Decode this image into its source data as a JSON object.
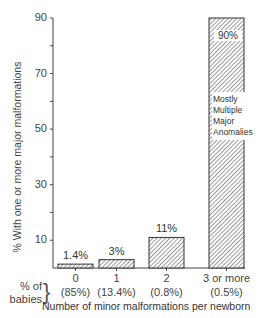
{
  "chart_data": {
    "type": "bar",
    "title": "",
    "xlabel": "Number of minor malformations per newborn",
    "ylabel": "% With one or more major malformations",
    "categories": [
      "0",
      "1",
      "2",
      "3 or more"
    ],
    "values": [
      1.4,
      3,
      11,
      90
    ],
    "value_labels": [
      "1.4%",
      "3%",
      "11%",
      "90%"
    ],
    "percent_of_babies": [
      "(85%)",
      "(13.4%)",
      "(0.8%)",
      "(0.5%)"
    ],
    "percent_of_babies_label": [
      "% of",
      "babies"
    ],
    "y_ticks": [
      10,
      30,
      50,
      70,
      90
    ],
    "ylim": [
      0,
      90
    ],
    "grid": false,
    "bar_fill": "hatched",
    "annotation": "Mostly Multiple Major Anomalies"
  },
  "annotation_lines": [
    "Mostly",
    "Multiple",
    "Major",
    "Anomalies"
  ]
}
